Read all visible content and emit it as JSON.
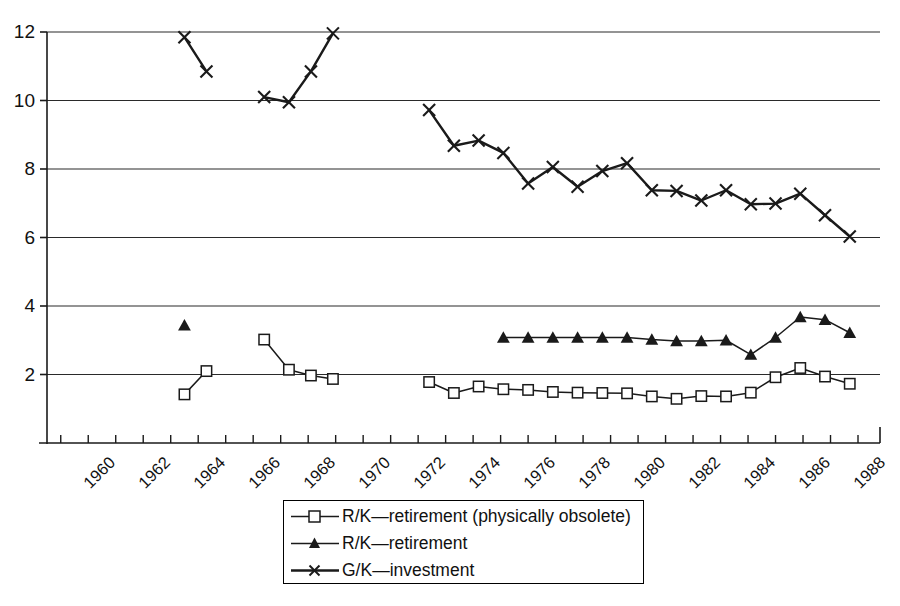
{
  "chart_data": {
    "type": "line",
    "title": "",
    "subtitle": "",
    "xlabel": "",
    "ylabel": "",
    "xlim": [
      1959.5,
      1989.8
    ],
    "ylim": [
      0,
      12.6
    ],
    "grid": "horizontal",
    "y_ticks": [
      2,
      4,
      6,
      8,
      10,
      12
    ],
    "y_tick_labels": [
      "2",
      "4",
      "6",
      "8",
      "10",
      "12"
    ],
    "x_ticks": [
      1960,
      1961,
      1962,
      1963,
      1964,
      1965,
      1966,
      1967,
      1968,
      1969,
      1970,
      1971,
      1972,
      1973,
      1974,
      1975,
      1976,
      1977,
      1978,
      1979,
      1980,
      1981,
      1982,
      1983,
      1984,
      1985,
      1986,
      1987,
      1988,
      1989
    ],
    "x_tick_labels": [
      "1960",
      "1962",
      "1964",
      "1966",
      "1968",
      "1970",
      "1972",
      "1974",
      "1976",
      "1978",
      "1980",
      "1982",
      "1984",
      "1986",
      "1988"
    ],
    "x_labeled_ticks": [
      1960,
      1962,
      1964,
      1966,
      1968,
      1970,
      1972,
      1974,
      1976,
      1978,
      1980,
      1982,
      1984,
      1986,
      1988
    ],
    "legend_position": "bottom-center",
    "series": [
      {
        "name": "R/K—retirement (physically obsolete)",
        "marker": "open-square",
        "color": "#1a1a1a",
        "segments": [
          {
            "x": [
              1964.5,
              1965.3
            ],
            "y": [
              1.42,
              2.1
            ]
          },
          {
            "x": [
              1967.4,
              1968.3,
              1969.1,
              1969.9
            ],
            "y": [
              3.02,
              2.14,
              1.97,
              1.87
            ]
          },
          {
            "x": [
              1973.4,
              1974.3,
              1975.2,
              1976.1,
              1977.0,
              1977.9,
              1978.8,
              1979.7,
              1980.6,
              1981.5,
              1982.4,
              1983.3,
              1984.2,
              1985.1,
              1986.0,
              1986.9,
              1987.8,
              1988.7
            ],
            "y": [
              1.78,
              1.46,
              1.65,
              1.57,
              1.55,
              1.49,
              1.47,
              1.46,
              1.45,
              1.36,
              1.29,
              1.37,
              1.36,
              1.47,
              1.92,
              2.19,
              1.94,
              1.73
            ]
          }
        ]
      },
      {
        "name": "R/K—retirement",
        "marker": "filled-triangle",
        "color": "#1a1a1a",
        "segments": [
          {
            "x": [
              1964.5
            ],
            "y": [
              3.44
            ]
          },
          {
            "x": [
              1976.1,
              1977.0,
              1977.9,
              1978.8,
              1979.7,
              1980.6,
              1981.5,
              1982.4,
              1983.3,
              1984.2,
              1985.1,
              1986.0,
              1986.9,
              1987.8,
              1988.7
            ],
            "y": [
              3.08,
              3.08,
              3.08,
              3.08,
              3.08,
              3.08,
              3.02,
              2.98,
              2.98,
              3.0,
              2.58,
              3.08,
              3.68,
              3.6,
              3.22
            ]
          }
        ]
      },
      {
        "name": "G/K—investment",
        "marker": "cross-x",
        "color": "#1a1a1a",
        "segments": [
          {
            "x": [
              1964.5,
              1965.3
            ],
            "y": [
              11.85,
              10.85
            ]
          },
          {
            "x": [
              1967.4,
              1968.3,
              1969.1,
              1969.9
            ],
            "y": [
              10.1,
              9.95,
              10.85,
              11.96
            ]
          },
          {
            "x": [
              1973.4,
              1974.3,
              1975.2,
              1976.1,
              1977.0,
              1977.9,
              1978.8,
              1979.7,
              1980.6,
              1981.5,
              1982.4,
              1983.3,
              1984.2,
              1985.1,
              1986.0,
              1986.9,
              1987.8,
              1988.7
            ],
            "y": [
              9.72,
              8.68,
              8.83,
              8.47,
              7.58,
              8.06,
              7.48,
              7.94,
              8.17,
              7.38,
              7.36,
              7.08,
              7.38,
              6.97,
              6.99,
              7.28,
              6.65,
              6.03
            ]
          }
        ]
      }
    ]
  },
  "legend": {
    "items": [
      {
        "label": "R/K—retirement (physically obsolete)",
        "marker": "open-square"
      },
      {
        "label": "R/K—retirement",
        "marker": "filled-triangle"
      },
      {
        "label": "G/K—investment",
        "marker": "cross-x"
      }
    ]
  }
}
